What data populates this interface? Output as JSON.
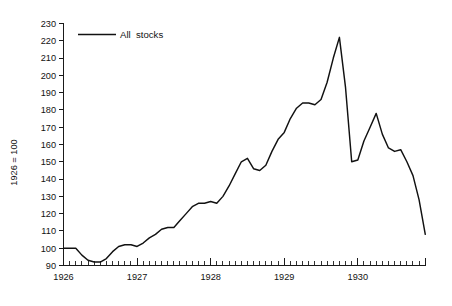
{
  "chart_data": {
    "type": "line",
    "title": "",
    "xlabel": "",
    "ylabel": "1926 = 100",
    "ylim": [
      90,
      230
    ],
    "xlim": [
      1926.0,
      1930.92
    ],
    "grid": false,
    "legend_position": "top-left",
    "y_ticks": [
      90,
      100,
      110,
      120,
      130,
      140,
      150,
      160,
      170,
      180,
      190,
      200,
      210,
      220,
      230
    ],
    "x_ticks": [
      1926,
      1927,
      1928,
      1929,
      1930
    ],
    "x_minor_tick_interval_months": 1,
    "series": [
      {
        "name": "All  stocks",
        "color": "#111111",
        "x": [
          1926.0,
          1926.083,
          1926.167,
          1926.25,
          1926.333,
          1926.417,
          1926.5,
          1926.583,
          1926.667,
          1926.75,
          1926.833,
          1926.917,
          1927.0,
          1927.083,
          1927.167,
          1927.25,
          1927.333,
          1927.417,
          1927.5,
          1927.583,
          1927.667,
          1927.75,
          1927.833,
          1927.917,
          1928.0,
          1928.083,
          1928.167,
          1928.25,
          1928.333,
          1928.417,
          1928.5,
          1928.583,
          1928.667,
          1928.75,
          1928.833,
          1928.917,
          1929.0,
          1929.083,
          1929.167,
          1929.25,
          1929.333,
          1929.417,
          1929.5,
          1929.583,
          1929.667,
          1929.75,
          1929.833,
          1929.917,
          1930.0,
          1930.083,
          1930.167,
          1930.25,
          1930.333,
          1930.417,
          1930.5,
          1930.583,
          1930.667,
          1930.75,
          1930.833,
          1930.917
        ],
        "values": [
          100,
          100,
          100,
          96,
          93,
          92,
          92,
          94,
          98,
          101,
          102,
          102,
          101,
          103,
          106,
          108,
          111,
          112,
          112,
          116,
          120,
          124,
          126,
          126,
          127,
          126,
          130,
          136,
          143,
          150,
          152,
          146,
          145,
          148,
          156,
          163,
          167,
          175,
          181,
          184,
          184,
          183,
          186,
          196,
          210,
          222,
          193,
          150,
          151,
          162,
          170,
          178,
          166,
          158,
          156,
          157,
          150,
          142,
          128,
          108
        ]
      }
    ],
    "annotations": []
  },
  "legend": {
    "entries": [
      {
        "label": "All  stocks",
        "color": "#111111"
      }
    ]
  },
  "axes": {
    "y_axis_title": "1926 = 100",
    "y_tick_labels": [
      "90",
      "100",
      "110",
      "120",
      "130",
      "140",
      "150",
      "160",
      "170",
      "180",
      "190",
      "200",
      "210",
      "220",
      "230"
    ],
    "x_tick_labels": [
      "1926",
      "1927",
      "1928",
      "1929",
      "1930"
    ]
  }
}
